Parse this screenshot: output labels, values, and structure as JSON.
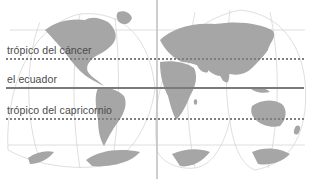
{
  "diagram": {
    "title": "",
    "type": "world map with latitude reference lines",
    "labels": {
      "tropic_cancer": "trópico del cáncer",
      "equator": "el ecuador",
      "tropic_capricorn": "trópico del capricornio"
    },
    "lines": [
      {
        "name": "tropic_cancer",
        "style": "dotted",
        "y": 59
      },
      {
        "name": "equator",
        "style": "solid",
        "y": 88
      },
      {
        "name": "tropic_capricorn",
        "style": "dotted",
        "y": 119
      },
      {
        "name": "prime_meridian",
        "style": "solid-vertical",
        "x": 157
      }
    ],
    "colors": {
      "land": "#a6a6a6",
      "graticule": "#d4d4d4",
      "equator": "#7a7a7a",
      "tropic_dots": "#7f7f7f",
      "meridian": "#c2c2c2",
      "label_text": "#4a4a4a"
    }
  }
}
